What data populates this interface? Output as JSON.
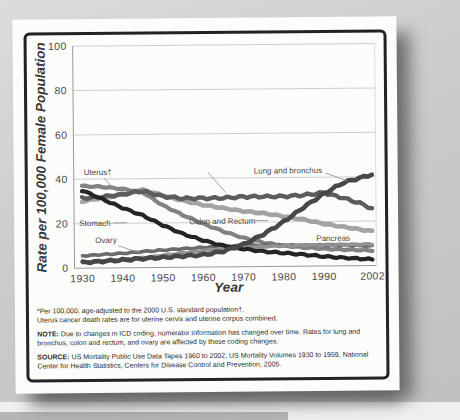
{
  "figure": {
    "footnotes": {
      "line1": "*Per 100,000, age-adjusted to the 2000 U.S. standard population†.",
      "line2": "Uterus cancer death rates are for uterine cervix and uterine corpus combined.",
      "note_label": "NOTE:",
      "note_text": "Due to changes in ICD coding, numerator information has changed over time. Rates for lung and bronchus, colon and rectum, and ovary are affected by these coding changes.",
      "source_label": "SOURCE:",
      "source_text": "US Mortality Public Use Data Tapes 1960 to 2002, US Mortality Volumes 1930 to 1959, National Center for Health Statistics, Centers for Disease Control and Prevention, 2005."
    }
  },
  "chart_data": {
    "type": "line",
    "title": "",
    "xlabel": "Year",
    "ylabel": "Rate per 100,000 Female Population",
    "xlim": [
      1928,
      2003
    ],
    "ylim": [
      0,
      100
    ],
    "grid": true,
    "x_ticks": [
      1930,
      1940,
      1950,
      1960,
      1970,
      1980,
      1990,
      2002
    ],
    "y_ticks": [
      0,
      20,
      40,
      60,
      80,
      100
    ],
    "x": [
      1930,
      1935,
      1940,
      1945,
      1950,
      1955,
      1960,
      1965,
      1970,
      1975,
      1980,
      1985,
      1990,
      1995,
      2000,
      2002
    ],
    "series": [
      {
        "name": "Colon and Rectum",
        "color": "#a3a3a6",
        "width": 4.6,
        "wobble": 0.3,
        "values": [
          30,
          31.5,
          33,
          35,
          32.5,
          30,
          28,
          26.5,
          25,
          24,
          22.5,
          21,
          19,
          17.5,
          16,
          15.5
        ]
      },
      {
        "name": "Uterus",
        "color": "#828286",
        "width": 4.2,
        "wobble": 0.3,
        "values": [
          37,
          36.5,
          35.5,
          34,
          28,
          23.5,
          19.5,
          16,
          13,
          10.8,
          9.3,
          8.4,
          7.8,
          7.3,
          7,
          6.8
        ]
      },
      {
        "name": "Ovary",
        "color": "#6a6a6e",
        "width": 3.6,
        "wobble": 0.25,
        "values": [
          5.5,
          6,
          6.5,
          7.2,
          7.8,
          8.3,
          8.8,
          9.2,
          9.6,
          9.6,
          9.5,
          9.4,
          9.4,
          9.4,
          9,
          8.8
        ]
      },
      {
        "name": "Pancreas",
        "color": "#919194",
        "width": 3.6,
        "wobble": 0.25,
        "values": [
          2.5,
          3,
          3.6,
          4.4,
          5.4,
          6.4,
          7.4,
          8.1,
          8.7,
          9,
          9.2,
          9.4,
          9.5,
          9.6,
          9.6,
          9.6
        ]
      },
      {
        "name": "Breast",
        "color": "#5c5c5f",
        "width": 4.4,
        "wobble": 0.5,
        "values": [
          31.5,
          32,
          33,
          34.5,
          32,
          31,
          31,
          31,
          31.5,
          31.5,
          31.5,
          32,
          33,
          30.5,
          27.5,
          25.5
        ]
      },
      {
        "name": "Stomach",
        "color": "#242426",
        "width": 4.2,
        "wobble": 0.35,
        "values": [
          35,
          31,
          27,
          23.5,
          19,
          15,
          12,
          9.5,
          8,
          6.8,
          6,
          5.2,
          4.3,
          3.6,
          3,
          2.8
        ]
      },
      {
        "name": "Lung and bronchus",
        "color": "#474749",
        "width": 4.6,
        "wobble": 0.45,
        "values": [
          2.5,
          3,
          3.5,
          4,
          4.5,
          5,
          5.5,
          7,
          10,
          14.5,
          20,
          26.5,
          32.5,
          37.5,
          40,
          41
        ]
      }
    ],
    "annotations": [
      {
        "name": "uterus-label",
        "text": "Uterus†",
        "x": 55,
        "y": 139,
        "leader": [
          75,
          142,
          86,
          154
        ]
      },
      {
        "name": "breast-leader",
        "text": "",
        "leader": [
          179,
          137,
          197,
          158
        ]
      },
      {
        "name": "lung-label",
        "text": "Lung and bronchus",
        "x": 225,
        "y": 139,
        "leader": [
          297,
          139,
          318,
          147
        ]
      },
      {
        "name": "stomach-label",
        "text": "Stomach",
        "x": 50,
        "y": 190,
        "leader": [
          84,
          187,
          98,
          187
        ]
      },
      {
        "name": "colon-label",
        "text": "Colon and Rectum",
        "x": 160,
        "y": 189,
        "leader": [
          226,
          186,
          239,
          186
        ]
      },
      {
        "name": "ovary-label",
        "text": "Ovary",
        "x": 66,
        "y": 207,
        "leader": [
          89,
          210,
          110,
          217
        ]
      },
      {
        "name": "pancreas-label",
        "text": "Pancreas",
        "x": 287,
        "y": 207,
        "leader": [
          317,
          209,
          334,
          215
        ]
      }
    ]
  }
}
